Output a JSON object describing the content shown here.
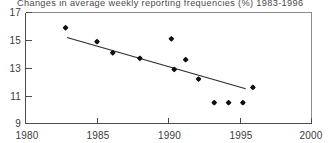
{
  "chart_data": {
    "type": "scatter",
    "title": "Changes in average weekly reporting frequencies (%) 1983-1996",
    "xlabel": "",
    "ylabel": "",
    "xlim": [
      1980,
      2000
    ],
    "ylim": [
      9,
      17
    ],
    "xticks": [
      "1980",
      "1985",
      "1990",
      "1995",
      "2000"
    ],
    "xtick_values": [
      1980,
      1985,
      1990,
      1995,
      2000
    ],
    "yticks": [
      "9",
      "11",
      "13",
      "15",
      "17"
    ],
    "ytick_values": [
      9,
      11,
      13,
      15,
      17
    ],
    "grid": false,
    "legend": null,
    "series": [
      {
        "name": "Average weekly reporting frequency (%)",
        "marker": "filled-diamond",
        "color": "#111111",
        "x": [
          1982.8,
          1985.0,
          1986.1,
          1988.0,
          1990.2,
          1990.4,
          1991.2,
          1992.1,
          1993.2,
          1994.2,
          1995.2,
          1995.9
        ],
        "y": [
          15.9,
          14.9,
          14.1,
          13.7,
          15.1,
          12.9,
          13.6,
          12.2,
          10.5,
          10.5,
          10.5,
          11.6
        ]
      },
      {
        "name": "Linear trend",
        "type": "line",
        "color": "#2b2b2b",
        "x": [
          1982.9,
          1995.4
        ],
        "y": [
          15.2,
          11.5
        ]
      }
    ]
  },
  "axes": {
    "y_axis_label_top": "17",
    "y_axis_label_bottom": "9",
    "x_axis_label_left": "1980",
    "x_axis_label_right": "2000"
  }
}
